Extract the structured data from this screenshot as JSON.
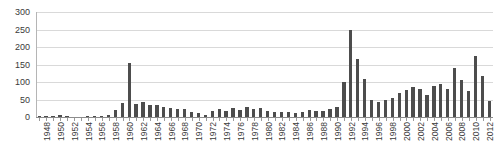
{
  "chart_data": {
    "type": "bar",
    "title": "",
    "subtitle": "",
    "xlabel": "",
    "ylabel": "",
    "xlim": [
      1948,
      2013
    ],
    "ylim": [
      0,
      300
    ],
    "grid": true,
    "legend": false,
    "legend_position": "none",
    "bar_color": "#4d4d4d",
    "grid_color": "#d9d9d9",
    "axis_color": "#8c8c8c",
    "y_ticks": [
      0,
      50,
      100,
      150,
      200,
      250,
      300
    ],
    "y_tick_labels": [
      "0",
      "50",
      "100",
      "150",
      "200",
      "250",
      "300"
    ],
    "x_tick_labels": [
      "1948",
      "1950",
      "1952",
      "1954",
      "1956",
      "1958",
      "1960",
      "1962",
      "1964",
      "1966",
      "1968",
      "1970",
      "1972",
      "1974",
      "1976",
      "1978",
      "1980",
      "1982",
      "1984",
      "1986",
      "1988",
      "1990",
      "1992",
      "1994",
      "1996",
      "1998",
      "2000",
      "2002",
      "2004",
      "2006",
      "2008",
      "2010",
      "2012"
    ],
    "x_tick_interval": 2,
    "categories": [
      1948,
      1949,
      1950,
      1951,
      1952,
      1953,
      1954,
      1955,
      1956,
      1957,
      1958,
      1959,
      1960,
      1961,
      1962,
      1963,
      1964,
      1965,
      1966,
      1967,
      1968,
      1969,
      1970,
      1971,
      1972,
      1973,
      1974,
      1975,
      1976,
      1977,
      1978,
      1979,
      1980,
      1981,
      1982,
      1983,
      1984,
      1985,
      1986,
      1987,
      1988,
      1989,
      1990,
      1991,
      1992,
      1993,
      1994,
      1995,
      1996,
      1997,
      1998,
      1999,
      2000,
      2001,
      2002,
      2003,
      2004,
      2005,
      2006,
      2007,
      2008,
      2009,
      2010,
      2011,
      2012,
      2013
    ],
    "values": [
      4,
      2,
      3,
      5,
      3,
      1,
      1,
      2,
      2,
      3,
      6,
      20,
      40,
      155,
      38,
      42,
      35,
      33,
      28,
      27,
      24,
      22,
      15,
      12,
      7,
      18,
      22,
      16,
      25,
      20,
      30,
      22,
      26,
      18,
      15,
      14,
      13,
      12,
      15,
      20,
      17,
      16,
      22,
      30,
      100,
      250,
      165,
      110,
      48,
      42,
      50,
      55,
      70,
      78,
      85,
      80,
      62,
      88,
      95,
      80,
      140,
      105,
      75,
      175,
      118,
      45
    ]
  }
}
